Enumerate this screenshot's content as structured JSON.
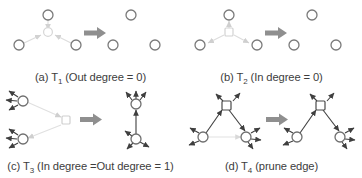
{
  "figure": {
    "title_absent": true,
    "background_color": "#ffffff",
    "node_stroke_color": "#6f6f6f",
    "node_fill_color": "#ffffff",
    "edge_color_active": "#3f3f3f",
    "edge_color_faded": "#d8d8d8",
    "transition_arrow_color": "#8c8c8c",
    "caption_color": "#3d3d3d",
    "layout": {
      "columns": 2,
      "rows": 2
    }
  },
  "panels": [
    {
      "id": "panel-a",
      "label": "(a)",
      "rule": "T",
      "rule_index": "1",
      "condition": "(Out degree = 0)",
      "caption_prefix": "(a) T",
      "caption_suffix": " (Out degree = 0)",
      "before": {
        "center_node": {
          "shape": "circle",
          "in_degree": 3,
          "out_degree": 0
        },
        "outer_nodes": 3,
        "edges": [
          {
            "from": "top",
            "to": "center",
            "direction": "in",
            "style": "faded"
          },
          {
            "from": "left",
            "to": "center",
            "direction": "in",
            "style": "faded"
          },
          {
            "from": "right",
            "to": "center",
            "direction": "in",
            "style": "faded"
          }
        ]
      },
      "after": {
        "center_node": null,
        "outer_nodes": 3,
        "edges": []
      }
    },
    {
      "id": "panel-b",
      "label": "(b)",
      "rule": "T",
      "rule_index": "2",
      "condition": "(In degree = 0)",
      "caption_prefix": "(b) T",
      "caption_suffix": " (In degree = 0)",
      "before": {
        "center_node": {
          "shape": "square",
          "in_degree": 0,
          "out_degree": 3
        },
        "outer_nodes": 3,
        "edges": [
          {
            "from": "center",
            "to": "top",
            "direction": "out",
            "style": "faded"
          },
          {
            "from": "center",
            "to": "left",
            "direction": "out",
            "style": "faded"
          },
          {
            "from": "center",
            "to": "right",
            "direction": "out",
            "style": "faded"
          }
        ]
      },
      "after": {
        "center_node": null,
        "outer_nodes": 3,
        "edges": []
      }
    },
    {
      "id": "panel-c",
      "label": "(c)",
      "rule": "T",
      "rule_index": "3",
      "condition": "(In degree =Out degree = 1)",
      "caption_prefix": "(c) T",
      "caption_suffix": " (In degree =Out degree = 1)",
      "before": {
        "center_node": {
          "shape": "square",
          "in_degree": 1,
          "out_degree": 1
        },
        "outer_nodes": 2,
        "outer_node_stubs": 3,
        "edges": [
          {
            "from": "upper-left",
            "to": "center",
            "direction": "in",
            "style": "faded"
          },
          {
            "from": "center",
            "to": "lower-left",
            "direction": "out",
            "style": "faded"
          }
        ]
      },
      "after": {
        "center_node": null,
        "outer_nodes": 2,
        "outer_node_stubs": 3,
        "edges": [
          {
            "from": "bottom",
            "to": "top",
            "direction": "up",
            "style": "active"
          }
        ]
      }
    },
    {
      "id": "panel-d",
      "label": "(d)",
      "rule": "T",
      "rule_index": "4",
      "condition": "(prune edge)",
      "caption_prefix": "(d) T",
      "caption_suffix": " (prune edge)",
      "before": {
        "center_node": {
          "shape": "square",
          "in_degree": 2,
          "out_degree": 2
        },
        "outer_nodes": 2,
        "edges": [
          {
            "from": "bottom-left",
            "to": "top",
            "direction": "up-right",
            "style": "active"
          },
          {
            "from": "top",
            "to": "bottom-right",
            "direction": "down-right",
            "style": "active"
          },
          {
            "from": "bottom-left",
            "to": "bottom-right",
            "direction": "right",
            "style": "faded"
          }
        ]
      },
      "after": {
        "center_node": {
          "shape": "square",
          "in_degree": 1,
          "out_degree": 1
        },
        "outer_nodes": 2,
        "edges": [
          {
            "from": "bottom-left",
            "to": "top",
            "direction": "up-right",
            "style": "active"
          },
          {
            "from": "top",
            "to": "bottom-right",
            "direction": "down-right",
            "style": "active"
          }
        ]
      }
    }
  ],
  "transition_arrows": [
    {
      "panel": "panel-a",
      "glyph": "thick-right-arrow"
    },
    {
      "panel": "panel-b",
      "glyph": "thick-right-arrow"
    },
    {
      "panel": "panel-c",
      "glyph": "thick-right-arrow"
    },
    {
      "panel": "panel-d",
      "glyph": "thick-right-arrow"
    }
  ]
}
